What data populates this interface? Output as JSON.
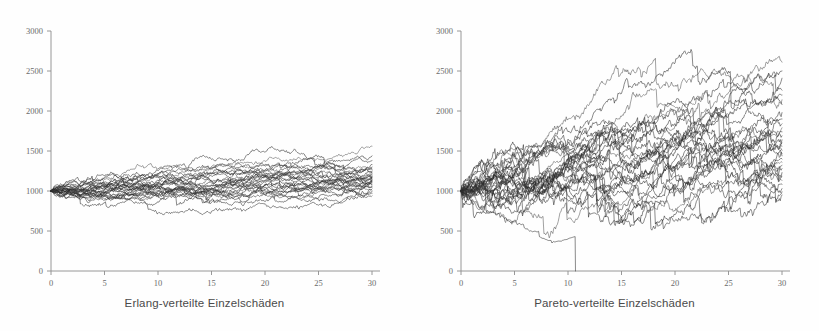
{
  "figure": {
    "background_color": "#fefefe",
    "trace_color": "#2a2a2a",
    "axis_color": "#8d8d8d",
    "tick_label_color": "#6b6b6b",
    "caption_color": "#4a4a4a"
  },
  "panels": [
    {
      "id": "erlang",
      "caption": "Erlang-verteilte Einzelschäden"
    },
    {
      "id": "pareto",
      "caption": "Pareto-verteilte Einzelschäden"
    }
  ],
  "chart_data": [
    {
      "type": "line",
      "title": "",
      "xlabel": "Erlang-verteilte Einzelschäden",
      "ylabel": "",
      "xlim": [
        0,
        30
      ],
      "ylim": [
        0,
        3000
      ],
      "xticks": [
        0,
        5,
        10,
        15,
        20,
        25,
        30
      ],
      "yticks": [
        0,
        500,
        1000,
        1500,
        2000,
        2500,
        3000
      ],
      "xtick_labels": [
        "0",
        "5",
        "10",
        "15",
        "20",
        "25",
        "30"
      ],
      "ytick_labels": [
        "0",
        "500",
        "1000",
        "1500",
        "2000",
        "2500",
        "3000"
      ],
      "grid": false,
      "legend": null,
      "n_series": 30,
      "start_value": 1000,
      "description": "30 simulated surplus random-walk paths starting at 1000, Erlang-distributed claim sizes; modest fanning with mild upward drift.",
      "series_summary": {
        "x_start": 0,
        "x_end": 30,
        "y_start_all": 1000,
        "y_end_min": 940,
        "y_end_max": 1560,
        "y_end_median": 1150,
        "drift_per_unit_x": 5,
        "volatility": 38
      },
      "series": [
        {
          "name": "path-1",
          "end_value": 1560
        },
        {
          "name": "path-2",
          "end_value": 1440
        },
        {
          "name": "path-3",
          "end_value": 1380
        },
        {
          "name": "path-4",
          "end_value": 1330
        },
        {
          "name": "path-5",
          "end_value": 1300
        },
        {
          "name": "path-6",
          "end_value": 1280
        },
        {
          "name": "path-7",
          "end_value": 1265
        },
        {
          "name": "path-8",
          "end_value": 1250
        },
        {
          "name": "path-9",
          "end_value": 1235
        },
        {
          "name": "path-10",
          "end_value": 1220
        },
        {
          "name": "path-11",
          "end_value": 1205
        },
        {
          "name": "path-12",
          "end_value": 1190
        },
        {
          "name": "path-13",
          "end_value": 1180
        },
        {
          "name": "path-14",
          "end_value": 1170
        },
        {
          "name": "path-15",
          "end_value": 1160
        },
        {
          "name": "path-16",
          "end_value": 1150
        },
        {
          "name": "path-17",
          "end_value": 1140
        },
        {
          "name": "path-18",
          "end_value": 1130
        },
        {
          "name": "path-19",
          "end_value": 1120
        },
        {
          "name": "path-20",
          "end_value": 1110
        },
        {
          "name": "path-21",
          "end_value": 1100
        },
        {
          "name": "path-22",
          "end_value": 1085
        },
        {
          "name": "path-23",
          "end_value": 1070
        },
        {
          "name": "path-24",
          "end_value": 1055
        },
        {
          "name": "path-25",
          "end_value": 1040
        },
        {
          "name": "path-26",
          "end_value": 1025
        },
        {
          "name": "path-27",
          "end_value": 1010
        },
        {
          "name": "path-28",
          "end_value": 990
        },
        {
          "name": "path-29",
          "end_value": 970
        },
        {
          "name": "path-30",
          "end_value": 940
        }
      ]
    },
    {
      "type": "line",
      "title": "",
      "xlabel": "Pareto-verteilte Einzelschäden",
      "ylabel": "",
      "xlim": [
        0,
        30
      ],
      "ylim": [
        0,
        3000
      ],
      "xticks": [
        0,
        5,
        10,
        15,
        20,
        25,
        30
      ],
      "yticks": [
        0,
        500,
        1000,
        1500,
        2000,
        2500,
        3000
      ],
      "xtick_labels": [
        "0",
        "5",
        "10",
        "15",
        "20",
        "25",
        "30"
      ],
      "ytick_labels": [
        "0",
        "500",
        "1000",
        "1500",
        "2000",
        "2500",
        "3000"
      ],
      "grid": false,
      "legend": null,
      "n_series": 30,
      "start_value": 1000,
      "description": "30 simulated surplus random-walk paths starting at 1000, Pareto-distributed claim sizes; much wider fanning, strong upward drift, and one ruin path that drops vertically to 0 near x=10.7.",
      "series_summary": {
        "x_start": 0,
        "x_end": 30,
        "y_start_all": 1000,
        "y_end_min": 950,
        "y_end_max": 2610,
        "y_end_median": 1600,
        "drift_per_unit_x": 22,
        "volatility": 85
      },
      "ruin_event": {
        "x": 10.7,
        "y_before": 430,
        "y_after": 0,
        "note": "vertical drop to zero"
      },
      "series": [
        {
          "name": "path-1",
          "end_value": 2610
        },
        {
          "name": "path-2",
          "end_value": 2500
        },
        {
          "name": "path-3",
          "end_value": 2410
        },
        {
          "name": "path-4",
          "end_value": 2260
        },
        {
          "name": "path-5",
          "end_value": 2200
        },
        {
          "name": "path-6",
          "end_value": 2140
        },
        {
          "name": "path-7",
          "end_value": 2080
        },
        {
          "name": "path-8",
          "end_value": 1980
        },
        {
          "name": "path-9",
          "end_value": 1900
        },
        {
          "name": "path-10",
          "end_value": 1840
        },
        {
          "name": "path-11",
          "end_value": 1790
        },
        {
          "name": "path-12",
          "end_value": 1740
        },
        {
          "name": "path-13",
          "end_value": 1690
        },
        {
          "name": "path-14",
          "end_value": 1640
        },
        {
          "name": "path-15",
          "end_value": 1600
        },
        {
          "name": "path-16",
          "end_value": 1560
        },
        {
          "name": "path-17",
          "end_value": 1510
        },
        {
          "name": "path-18",
          "end_value": 1470
        },
        {
          "name": "path-19",
          "end_value": 1440
        },
        {
          "name": "path-20",
          "end_value": 1400
        },
        {
          "name": "path-21",
          "end_value": 1360
        },
        {
          "name": "path-22",
          "end_value": 1320
        },
        {
          "name": "path-23",
          "end_value": 1280
        },
        {
          "name": "path-24",
          "end_value": 1230
        },
        {
          "name": "path-25",
          "end_value": 1180
        },
        {
          "name": "path-26",
          "end_value": 1130
        },
        {
          "name": "path-27",
          "end_value": 1080
        },
        {
          "name": "path-28",
          "end_value": 1030
        },
        {
          "name": "path-29",
          "end_value": 990
        },
        {
          "name": "path-30",
          "end_value": 950
        }
      ]
    }
  ]
}
